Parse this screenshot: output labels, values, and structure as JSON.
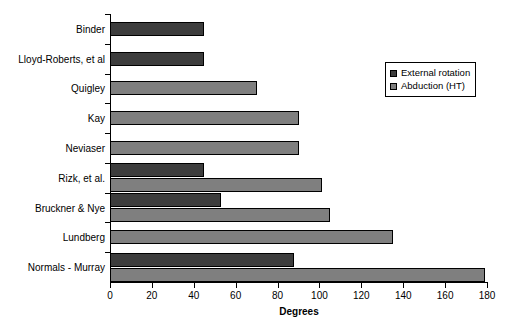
{
  "chart_data": {
    "type": "bar",
    "orientation": "horizontal",
    "title": "",
    "xlabel": "Degrees",
    "ylabel": "",
    "xlim": [
      0,
      180
    ],
    "xticks": [
      0,
      20,
      40,
      60,
      80,
      100,
      120,
      140,
      160,
      180
    ],
    "grid": false,
    "legend_position": "upper right",
    "categories": [
      "Binder",
      "Lloyd-Roberts, et al",
      "Quigley",
      "Kay",
      "Neviaser",
      "Rizk, et al.",
      "Bruckner & Nye",
      "Lundberg",
      "Normals - Murray"
    ],
    "series": [
      {
        "name": "External rotation",
        "color": "#3d3d3d",
        "values": [
          45,
          45,
          null,
          null,
          null,
          45,
          53,
          null,
          88
        ]
      },
      {
        "name": "Abduction (HT)",
        "color": "#7f7f7f",
        "values": [
          null,
          null,
          70,
          90,
          90,
          101,
          105,
          135,
          179
        ]
      }
    ]
  },
  "legend": {
    "entries": [
      {
        "label": "External rotation"
      },
      {
        "label": "Abduction (HT)"
      }
    ]
  },
  "axis": {
    "x_title": "Degrees",
    "tick_labels": [
      "0",
      "20",
      "40",
      "60",
      "80",
      "100",
      "120",
      "140",
      "160",
      "180"
    ]
  },
  "categories": [
    {
      "label": "Binder"
    },
    {
      "label": "Lloyd-Roberts, et al"
    },
    {
      "label": "Quigley"
    },
    {
      "label": "Kay"
    },
    {
      "label": "Neviaser"
    },
    {
      "label": "Rizk, et al."
    },
    {
      "label": "Bruckner & Nye"
    },
    {
      "label": "Lundberg"
    },
    {
      "label": "Normals - Murray"
    }
  ]
}
